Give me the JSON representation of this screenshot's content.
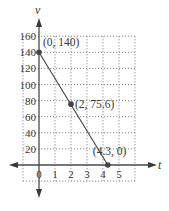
{
  "chart_data": {
    "type": "line",
    "title": "",
    "xlabel": "t",
    "ylabel": "v",
    "xlim": [
      -1,
      6
    ],
    "ylim": [
      -20,
      160
    ],
    "grid": true,
    "x_ticks": [
      0,
      1,
      2,
      3,
      4,
      5
    ],
    "x_tick_labels": [
      "0",
      "1",
      "2",
      "3",
      "4",
      "5"
    ],
    "y_ticks": [
      20,
      40,
      60,
      80,
      100,
      120,
      140,
      160
    ],
    "y_tick_labels": [
      "20",
      "40",
      "60",
      "80",
      "100",
      "120",
      "140",
      "160"
    ],
    "series": [
      {
        "name": "v(t)",
        "x": [
          0,
          4.3
        ],
        "y": [
          140,
          0
        ]
      }
    ],
    "points": [
      {
        "x": 0,
        "y": 140,
        "label": "(0, 140)"
      },
      {
        "x": 2,
        "y": 75.6,
        "label": "(2, 75.6)"
      },
      {
        "x": 4.3,
        "y": 0,
        "label": "(4.3, 0)"
      }
    ],
    "legend": "none"
  }
}
